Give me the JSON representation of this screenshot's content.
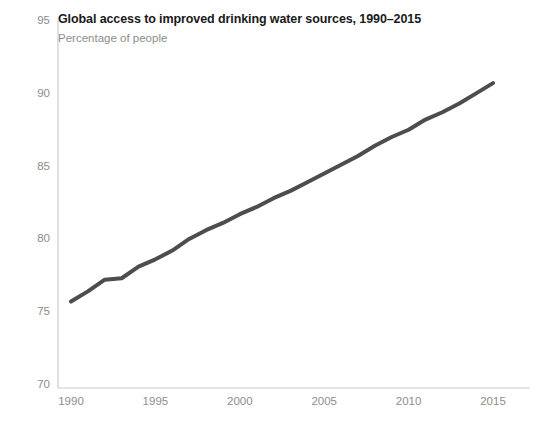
{
  "chart_data": {
    "type": "line",
    "title": "Global access to improved drinking water sources, 1990–2015",
    "subtitle": "Percentage of people",
    "xlabel": "",
    "ylabel": "",
    "xlim": [
      1989,
      2016
    ],
    "ylim": [
      70,
      95
    ],
    "grid": false,
    "legend": "none",
    "line_color": "#4d4d4d",
    "line_width_px": 4,
    "axis_color": "#cccccc",
    "tick_label_color": "#8d8d8d",
    "title_color": "#1a1a1a",
    "subtitle_color": "#8d8d8d",
    "xticks": [
      1990,
      1995,
      2000,
      2005,
      2010,
      2015
    ],
    "xtick_labels": [
      "1990",
      "1995",
      "2000",
      "2005",
      "2010",
      "2015"
    ],
    "yticks": [
      70,
      75,
      80,
      85,
      90,
      95
    ],
    "ytick_labels": [
      "70",
      "75",
      "80",
      "85",
      "90",
      "95"
    ],
    "x": [
      1990,
      1991,
      1992,
      1993,
      1994,
      1995,
      1996,
      1997,
      1998,
      1999,
      2000,
      2001,
      2002,
      2003,
      2004,
      2005,
      2006,
      2007,
      2008,
      2009,
      2010,
      2011,
      2012,
      2013,
      2014,
      2015
    ],
    "values": [
      75.8,
      76.5,
      77.3,
      77.4,
      78.2,
      78.7,
      79.3,
      80.1,
      80.7,
      81.2,
      81.8,
      82.3,
      82.9,
      83.4,
      84.0,
      84.6,
      85.2,
      85.8,
      86.5,
      87.1,
      87.6,
      88.3,
      88.8,
      89.4,
      90.1,
      90.8
    ],
    "series_name": "Global access to improved drinking water sources"
  }
}
